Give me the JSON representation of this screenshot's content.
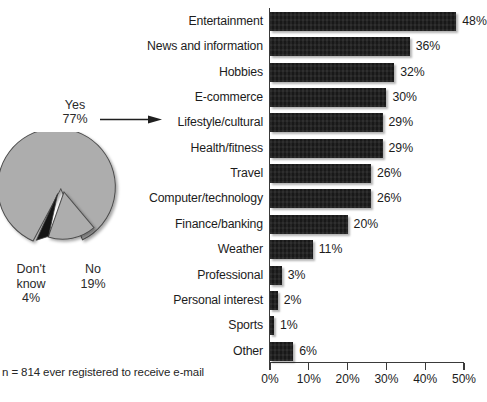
{
  "footnote": "n = 814 ever registered to receive e-mail",
  "pie": {
    "callout": {
      "name": "Yes",
      "value": "77%"
    },
    "labels": [
      {
        "name": "Don't\nknow",
        "line1": "Don't",
        "line2": "know",
        "value": "4%"
      },
      {
        "name": "No",
        "line1": "No",
        "line2": "",
        "value": "19%"
      }
    ],
    "colors": {
      "slice_gray": "#adadad",
      "slice_black": "#141414",
      "outline": "#4d4d4d"
    }
  },
  "chart_data": [
    {
      "type": "pie",
      "title": "",
      "labels": [
        "Yes",
        "No",
        "Don't know"
      ],
      "values": [
        77,
        19,
        4
      ],
      "value_labels": [
        "77%",
        "19%",
        "4%"
      ],
      "colors": [
        "#adadad",
        "#adadad",
        "#141414"
      ],
      "legend": "none",
      "notes": "Exploded pie: 'No' and 'Don't know' wedges separated from 'Yes' wedge"
    },
    {
      "type": "bar",
      "orientation": "horizontal",
      "title": "",
      "xlabel": "",
      "ylabel": "",
      "xlim": [
        0,
        50
      ],
      "xticks": [
        0,
        10,
        20,
        30,
        40,
        50
      ],
      "xtick_labels": [
        "0%",
        "10%",
        "20%",
        "30%",
        "40%",
        "50%"
      ],
      "grid": false,
      "legend": "none",
      "bar_color": "#1b1b1b",
      "categories": [
        "Entertainment",
        "News and information",
        "Hobbies",
        "E-commerce",
        "Lifestyle/cultural",
        "Health/fitness",
        "Travel",
        "Computer/technology",
        "Finance/banking",
        "Weather",
        "Professional",
        "Personal interest",
        "Sports",
        "Other"
      ],
      "values": [
        48,
        36,
        32,
        30,
        29,
        29,
        26,
        26,
        20,
        11,
        3,
        2,
        1,
        6
      ],
      "value_labels": [
        "48%",
        "36%",
        "32%",
        "30%",
        "29%",
        "29%",
        "26%",
        "26%",
        "20%",
        "11%",
        "3%",
        "2%",
        "1%",
        "6%"
      ]
    }
  ]
}
